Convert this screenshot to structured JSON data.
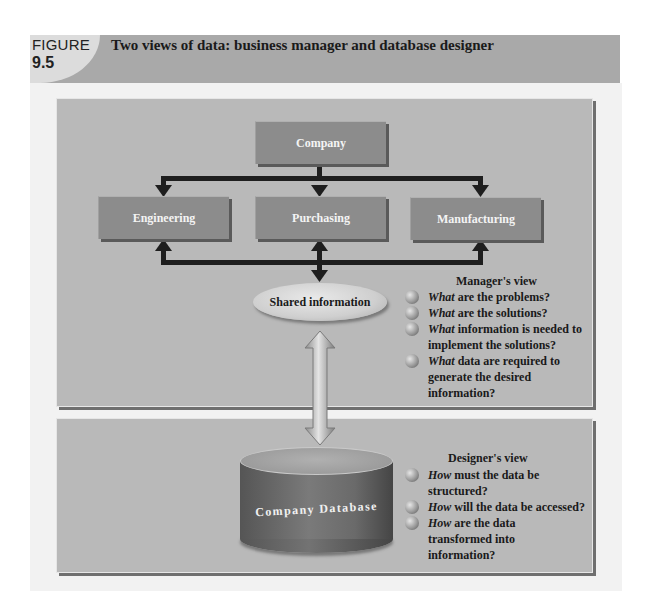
{
  "header": {
    "figure_label": "FIGURE",
    "figure_number": "9.5",
    "title": "Two views of data: business manager and database designer"
  },
  "org_chart": {
    "top": "Company",
    "departments": [
      "Engineering",
      "Purchasing",
      "Manufacturing"
    ],
    "shared": "Shared information"
  },
  "manager_view": {
    "title": "Manager's view",
    "items": [
      {
        "em": "What",
        "rest": " are the problems?"
      },
      {
        "em": "What",
        "rest": " are the solutions?"
      },
      {
        "em": "What",
        "rest": " information is needed to implement the solutions?"
      },
      {
        "em": "What",
        "rest": " data are required to generate the desired information?"
      }
    ]
  },
  "database": {
    "label": "Company Database"
  },
  "designer_view": {
    "title": "Designer's view",
    "items": [
      {
        "em": "How",
        "rest": " must the data be structured?"
      },
      {
        "em": "How",
        "rest": " will the data be accessed?"
      },
      {
        "em": "How",
        "rest": " are the data transformed into information?"
      }
    ]
  },
  "colors": {
    "panel": "#b9b9b9",
    "box": "#8c8c8c",
    "header_band": "#a9a9a9",
    "arrow": "#1e1e1e"
  }
}
